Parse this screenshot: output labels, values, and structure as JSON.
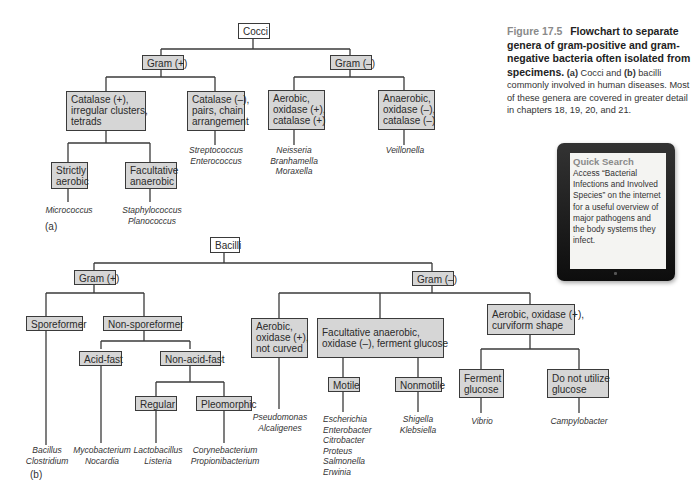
{
  "caption": {
    "figure_number": "Figure 17.5",
    "title": "Flowchart to separate genera of gram-positive and gram-negative bacteria often isolated from specimens.",
    "body_a_label": "(a)",
    "body_a_text": " Cocci and ",
    "body_b_label": "(b)",
    "body_b_text": " bacilli commonly involved in human diseases. Most of these genera are covered in greater detail in chapters 18, 19, 20, and 21."
  },
  "quick_search": {
    "title": "Quick Search",
    "body": "Access “Bacterial Infections and Involved Species” on the internet for a useful overview of major pathogens and the body systems they infect."
  },
  "cocci": {
    "root": "Cocci",
    "gram_pos": "Gram (+)",
    "gram_neg": "Gram (–)",
    "catalase_pos": [
      "Catalase (+),",
      "irregular clusters,",
      "tetrads"
    ],
    "catalase_neg": [
      "Catalase (–),",
      "pairs, chain",
      "arrangement"
    ],
    "aerobic": [
      "Aerobic,",
      "oxidase (+),",
      "catalase (+)"
    ],
    "anaerobic": [
      "Anaerobic,",
      "oxidase (–),",
      "catalase (–)"
    ],
    "strictly_aerobic": [
      "Strictly",
      "aerobic"
    ],
    "facultative_anaerobic": [
      "Facultative",
      "anaerobic"
    ],
    "genera": {
      "strictly_aerobic": [
        "Micrococcus"
      ],
      "facultative_anaerobic": [
        "Staphylococcus",
        "Planococcus"
      ],
      "catalase_neg": [
        "Streptococcus",
        "Enterococcus"
      ],
      "aerobic": [
        "Neisseria",
        "Branhamella",
        "Moraxella"
      ],
      "anaerobic": [
        "Veillonella"
      ]
    },
    "sub_label": "(a)"
  },
  "bacilli": {
    "root": "Bacilli",
    "gram_pos": "Gram (+)",
    "gram_neg": "Gram (–)",
    "sporeformer": "Sporeformer",
    "non_sporeformer": "Non-sporeformer",
    "acid_fast": "Acid-fast",
    "non_acid_fast": "Non-acid-fast",
    "regular": "Regular",
    "pleomorphic": "Pleomorphic",
    "aerobic_not_curved": [
      "Aerobic,",
      "oxidase (+),",
      "not curved"
    ],
    "facultative": [
      "Facultative anaerobic,",
      "oxidase (–), ferment glucose"
    ],
    "curviform": [
      "Aerobic, oxidase (+),",
      "curviform shape"
    ],
    "motile": "Motile",
    "nonmotile": "Nonmotile",
    "ferment_glucose": [
      "Ferment",
      "glucose"
    ],
    "no_glucose": [
      "Do not utilize",
      "glucose"
    ],
    "genera": {
      "sporeformer": [
        "Bacillus",
        "Clostridium"
      ],
      "acid_fast": [
        "Mycobacterium",
        "Nocardia"
      ],
      "regular": [
        "Lactobacillus",
        "Listeria"
      ],
      "pleomorphic": [
        "Corynebacterium",
        "Propionibacterium"
      ],
      "aerobic_not_curved": [
        "Pseudomonas",
        "Alcaligenes"
      ],
      "motile": [
        "Escherichia",
        "Enterobacter",
        "Citrobacter",
        "Proteus",
        "Salmonella",
        "Erwinia"
      ],
      "nonmotile": [
        "Shigella",
        "Klebsiella"
      ],
      "ferment_glucose": [
        "Vibrio"
      ],
      "no_glucose": [
        "Campylobacter"
      ]
    },
    "sub_label": "(b)"
  }
}
